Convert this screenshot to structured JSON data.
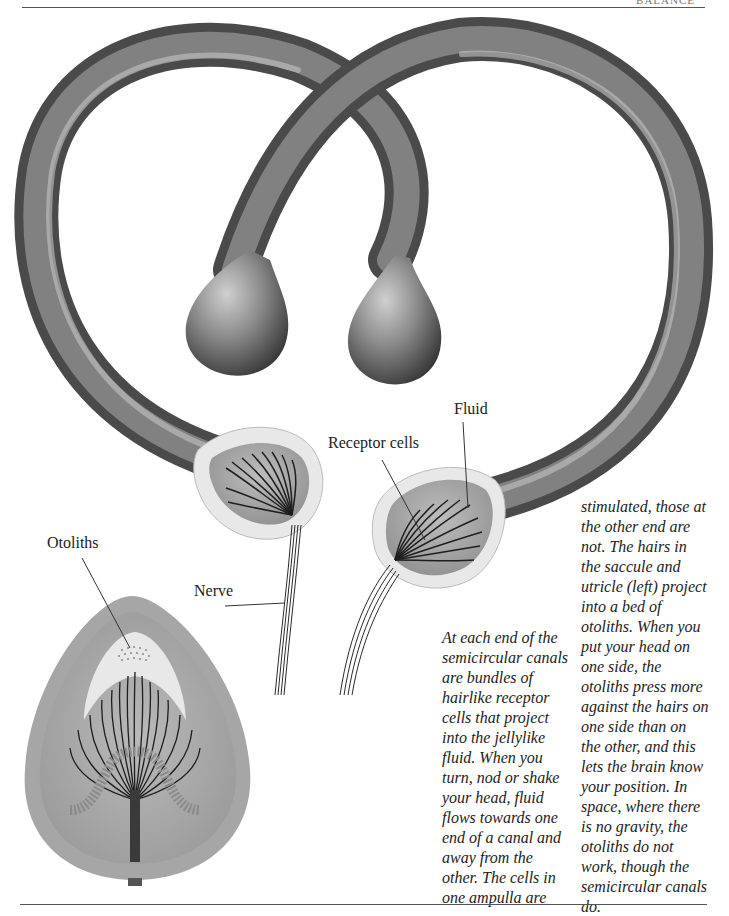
{
  "header": {
    "running_title": "BALANCE"
  },
  "labels": {
    "fluid": "Fluid",
    "receptor_cells": "Receptor cells",
    "otoliths": "Otoliths",
    "nerve": "Nerve"
  },
  "body": {
    "column1": [
      "At each end of the",
      "semicircular canals",
      "are bundles of",
      "hairlike receptor",
      "cells that project",
      "into the jellylike",
      "fluid. When you",
      "turn, nod or shake",
      "your head, fluid",
      "flows towards one",
      "end of a canal and",
      "away from the",
      "other. The cells in",
      "one ampulla are"
    ],
    "column2": [
      "stimulated, those at",
      "the other end are",
      "not. The hairs in",
      "the saccule and",
      "utricle (left) project",
      "into a bed of",
      "otoliths. When you",
      "put your head on",
      "one side, the",
      "otoliths press more",
      "against the hairs on",
      "one side than on",
      "the other, and this",
      "lets the brain know",
      "your position. In",
      "space, where there",
      "is no gravity, the",
      "otoliths do not",
      "work, though the",
      "semicircular canals",
      "do."
    ]
  },
  "colors": {
    "canal_dark": "#3c3c3c",
    "canal_mid": "#7a7a7a",
    "canal_light": "#b8b8b8",
    "cut_rim": "#e6e6e6",
    "fluid_fill": "#a9a9a9",
    "hair": "#1e1e1e"
  }
}
